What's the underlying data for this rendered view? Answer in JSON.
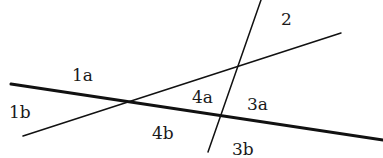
{
  "diagram": {
    "type": "intersecting-lines",
    "colors": {
      "line": "#111111",
      "text": "#1a1a1a",
      "background": "#ffffff"
    },
    "lines": [
      {
        "id": "line-1",
        "weight": "thick",
        "x1": 11,
        "y1": 84,
        "x2": 383,
        "y2": 140
      },
      {
        "id": "line-a",
        "weight": "thin",
        "x1": 23,
        "y1": 136,
        "x2": 341,
        "y2": 33
      },
      {
        "id": "line-b",
        "weight": "thin",
        "x1": 261,
        "y1": 0,
        "x2": 208,
        "y2": 152
      }
    ],
    "labels": [
      {
        "id": "1a",
        "text": "1a",
        "x": 72,
        "y": 81
      },
      {
        "id": "1b",
        "text": "1b",
        "x": 9,
        "y": 118
      },
      {
        "id": "2",
        "text": "2",
        "x": 281,
        "y": 25
      },
      {
        "id": "4a",
        "text": "4a",
        "x": 192,
        "y": 103
      },
      {
        "id": "3a",
        "text": "3a",
        "x": 247,
        "y": 110
      },
      {
        "id": "4b",
        "text": "4b",
        "x": 152,
        "y": 139
      },
      {
        "id": "3b",
        "text": "3b",
        "x": 232,
        "y": 155
      }
    ]
  }
}
